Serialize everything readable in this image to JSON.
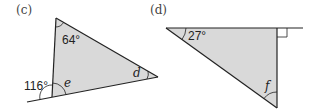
{
  "figures": [
    {
      "label": "(c)",
      "angles": {
        "top": "64°",
        "exterior": "116°",
        "unknown_bottom": "e",
        "unknown_right": "d"
      }
    },
    {
      "label": "(d)",
      "angles": {
        "top_left": "27°",
        "unknown_bottom": "f"
      }
    }
  ],
  "colors": {
    "fill": "#d9d9d9",
    "stroke": "#222222"
  }
}
